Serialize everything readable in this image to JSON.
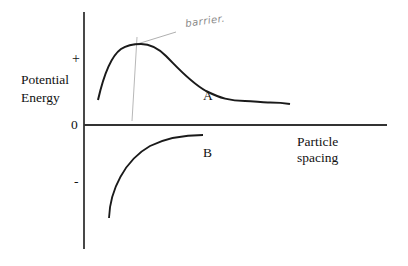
{
  "diagram": {
    "y_axis": {
      "label_line1": "Potential",
      "label_line2": "Energy",
      "tick_plus": "+",
      "tick_zero": "0",
      "tick_minus": "-"
    },
    "x_axis": {
      "label_line1": "Particle",
      "label_line2": "spacing"
    },
    "curves": [
      {
        "name": "A",
        "label": "A",
        "description": "Rises steeply from near zero to a positive peak (energy barrier), then decays and levels off above zero"
      },
      {
        "name": "B",
        "label": "B",
        "description": "Negative curve rising from deep below zero toward zero as spacing increases"
      }
    ],
    "annotation": {
      "text": "barrier.",
      "style": "handwritten",
      "color": "#8a8a8a"
    },
    "colors": {
      "axis": "#1a1a1a",
      "curve": "#1a1a1a",
      "annotation": "#9a9a9a",
      "background": "#ffffff"
    }
  }
}
